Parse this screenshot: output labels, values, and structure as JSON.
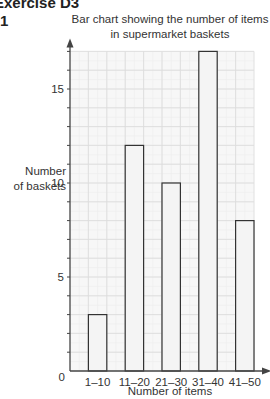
{
  "page": {
    "heading": "Exercise D3",
    "question_number": "1"
  },
  "chart_data": {
    "type": "bar",
    "title": "Bar chart showing the number of items in supermarket baskets",
    "title_lines": [
      "Bar chart showing the number of items",
      "in supermarket baskets"
    ],
    "xlabel": "Number of items",
    "ylabel": "Number of baskets",
    "ylabel_lines": [
      "Number",
      "of baskets"
    ],
    "categories": [
      "1–10",
      "11–20",
      "21–30",
      "31–40",
      "41–50"
    ],
    "values": [
      3,
      12,
      10,
      17,
      8
    ],
    "ylim": [
      0,
      17
    ],
    "yticks": [
      0,
      5,
      10,
      15
    ],
    "origin_label": "0",
    "grid": true,
    "legend": null,
    "colors": {
      "bar_fill": "#f4f4f4",
      "bar_stroke": "#333333",
      "grid": "#dcdcdc",
      "axis": "#444444"
    }
  }
}
